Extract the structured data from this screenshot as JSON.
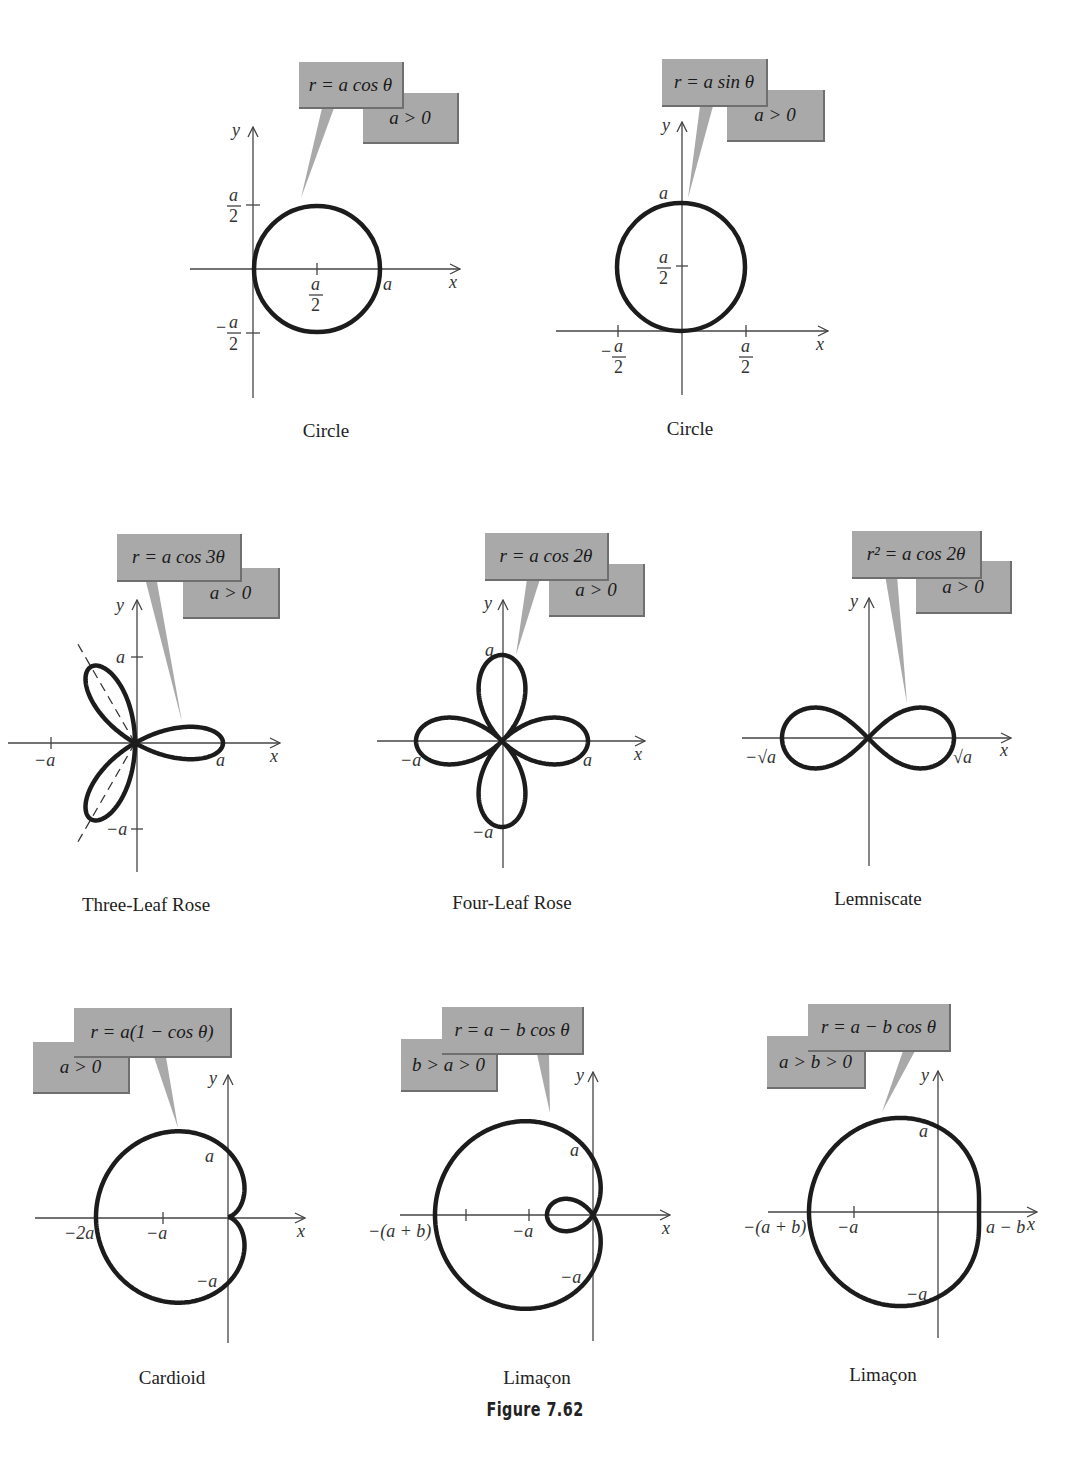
{
  "figure": {
    "caption": "Figure 7.62",
    "callout_color": "#a9a9a9",
    "curve_color": "#1c1c1c"
  },
  "panels": [
    {
      "id": "circle-cos",
      "title": "Circle",
      "equation": "r = a cos θ",
      "condition": "a > 0",
      "axis_labels": {
        "x": "x",
        "y": "y"
      },
      "tick_labels": {
        "y_top": "a/2",
        "y_bottom": "−a/2",
        "x_mid": "a/2",
        "x_right": "a"
      }
    },
    {
      "id": "circle-sin",
      "title": "Circle",
      "equation": "r = a sin θ",
      "condition": "a > 0",
      "axis_labels": {
        "x": "x",
        "y": "y"
      },
      "tick_labels": {
        "y_top": "a",
        "y_mid": "a/2",
        "x_left": "−a/2",
        "x_right": "a/2"
      }
    },
    {
      "id": "three-leaf-rose",
      "title": "Three-Leaf Rose",
      "equation": "r = a cos 3θ",
      "condition": "a > 0",
      "axis_labels": {
        "x": "x",
        "y": "y"
      },
      "tick_labels": {
        "y_top": "a",
        "y_bottom": "−a",
        "x_left": "−a",
        "x_right": "a"
      }
    },
    {
      "id": "four-leaf-rose",
      "title": "Four-Leaf Rose",
      "equation": "r = a cos 2θ",
      "condition": "a > 0",
      "axis_labels": {
        "x": "x",
        "y": "y"
      },
      "tick_labels": {
        "y_top": "a",
        "y_bottom": "−a",
        "x_left": "−a",
        "x_right": "a"
      }
    },
    {
      "id": "lemniscate",
      "title": "Lemniscate",
      "equation": "r² = a cos 2θ",
      "condition": "a > 0",
      "axis_labels": {
        "x": "x",
        "y": "y"
      },
      "tick_labels": {
        "x_left": "−√a",
        "x_right": "√a"
      }
    },
    {
      "id": "cardioid",
      "title": "Cardioid",
      "equation": "r = a(1 − cos θ)",
      "condition": "a > 0",
      "axis_labels": {
        "x": "x",
        "y": "y"
      },
      "tick_labels": {
        "y_top": "a",
        "y_bottom": "−a",
        "x_far_left": "−2a",
        "x_left": "−a"
      }
    },
    {
      "id": "limacon-loop",
      "title": "Limaçon",
      "equation": "r = a − b cos θ",
      "condition": "b > a > 0",
      "axis_labels": {
        "x": "x",
        "y": "y"
      },
      "tick_labels": {
        "y_top": "a",
        "y_bottom": "−a",
        "x_far_left": "−(a + b)",
        "x_left": "−a"
      }
    },
    {
      "id": "limacon-dimpled",
      "title": "Limaçon",
      "equation": "r = a − b cos θ",
      "condition": "a > b > 0",
      "axis_labels": {
        "x": "x",
        "y": "y"
      },
      "tick_labels": {
        "y_top": "a",
        "y_bottom": "−a",
        "x_far_left": "−(a + b)",
        "x_left": "−a",
        "x_right": "a − b"
      }
    }
  ]
}
